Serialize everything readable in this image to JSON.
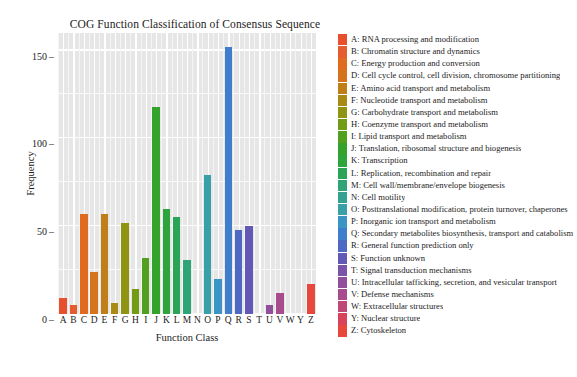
{
  "chart_data": {
    "type": "bar",
    "title": "COG Function Classification of Consensus Sequence",
    "xlabel": "Function Class",
    "ylabel": "Frequency",
    "categories": [
      "A",
      "B",
      "C",
      "D",
      "E",
      "F",
      "G",
      "H",
      "I",
      "J",
      "K",
      "L",
      "M",
      "N",
      "O",
      "P",
      "Q",
      "R",
      "S",
      "T",
      "U",
      "V",
      "W",
      "Y",
      "Z"
    ],
    "values": [
      9,
      5,
      57,
      24,
      57,
      6,
      52,
      14,
      32,
      118,
      60,
      55,
      31,
      0,
      79,
      20,
      152,
      48,
      50,
      0,
      5,
      12,
      0,
      0,
      17
    ],
    "ylim": [
      0,
      160
    ],
    "yticks": [
      0,
      50,
      100,
      150
    ],
    "ytick_labels": [
      "0",
      "50",
      "100",
      "150"
    ],
    "grid": true,
    "legend_position": "right",
    "bar_colors": [
      "#e8502d",
      "#e65c31",
      "#e06a1e",
      "#d4741c",
      "#c07e18",
      "#a98a15",
      "#8f9412",
      "#749b16",
      "#52a01f",
      "#34a32c",
      "#2ea53c",
      "#2aa558",
      "#2fa476",
      "#35a18f",
      "#39a0a8",
      "#3b95c4",
      "#3f7ecd",
      "#4f68c4",
      "#6159b5",
      "#7a54a6",
      "#93509a",
      "#a84c8e",
      "#bf4876",
      "#d6435a",
      "#e8483c"
    ]
  },
  "legend": {
    "items": [
      {
        "key": "A",
        "label": "A: RNA processing and modification",
        "color": "#e8502d"
      },
      {
        "key": "B",
        "label": "B: Chromatin structure and dynamics",
        "color": "#e65c31"
      },
      {
        "key": "C",
        "label": "C: Energy production and conversion",
        "color": "#e06a1e"
      },
      {
        "key": "D",
        "label": "D: Cell cycle control, cell division, chromosome partitioning",
        "color": "#d4741c"
      },
      {
        "key": "E",
        "label": "E: Amino acid transport and metabolism",
        "color": "#c07e18"
      },
      {
        "key": "F",
        "label": "F: Nucleotide transport and metabolism",
        "color": "#a98a15"
      },
      {
        "key": "G",
        "label": "G: Carbohydrate transport and metabolism",
        "color": "#8f9412"
      },
      {
        "key": "H",
        "label": "H: Coenzyme transport and metabolism",
        "color": "#749b16"
      },
      {
        "key": "I",
        "label": "I: Lipid transport and metabolism",
        "color": "#52a01f"
      },
      {
        "key": "J",
        "label": "J: Translation, ribosomal structure and biogenesis",
        "color": "#34a32c"
      },
      {
        "key": "K",
        "label": "K: Transcription",
        "color": "#2ea53c"
      },
      {
        "key": "L",
        "label": "L: Replication, recombination and repair",
        "color": "#2aa558"
      },
      {
        "key": "M",
        "label": "M: Cell wall/membrane/envelope biogenesis",
        "color": "#2fa476"
      },
      {
        "key": "N",
        "label": "N: Cell motility",
        "color": "#35a18f"
      },
      {
        "key": "O",
        "label": "O: Posttranslational modification, protein turnover, chaperones",
        "color": "#39a0a8"
      },
      {
        "key": "P",
        "label": "P: Inorganic ion transport and metabolism",
        "color": "#3b95c4"
      },
      {
        "key": "Q",
        "label": "Q: Secondary metabolites biosynthesis, transport and catabolism",
        "color": "#3f7ecd"
      },
      {
        "key": "R",
        "label": "R: General function prediction only",
        "color": "#4f68c4"
      },
      {
        "key": "S",
        "label": "S: Function unknown",
        "color": "#6159b5"
      },
      {
        "key": "T",
        "label": "T: Signal transduction mechanisms",
        "color": "#7a54a6"
      },
      {
        "key": "U",
        "label": "U: Intracellular tafficking, secretion, and vesicular transport",
        "color": "#93509a"
      },
      {
        "key": "V",
        "label": "V: Defense mechanisms",
        "color": "#a84c8e"
      },
      {
        "key": "W",
        "label": "W: Extracellular structures",
        "color": "#bf4876"
      },
      {
        "key": "Y",
        "label": "Y: Nuclear structure",
        "color": "#d6435a"
      },
      {
        "key": "Z",
        "label": "Z: Cytoskeleton",
        "color": "#e8483c"
      }
    ]
  },
  "caption": ""
}
